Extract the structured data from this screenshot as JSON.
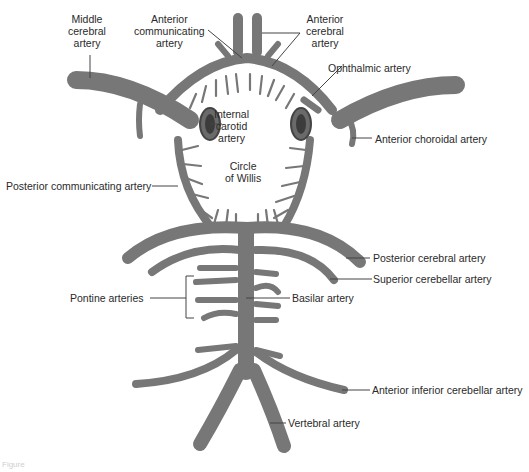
{
  "diagram": {
    "title": "Circle of Willis",
    "colors": {
      "vessel": "#7d7d7d",
      "vessel_edge": "#555555",
      "leader": "#444444",
      "text": "#2a2a2a",
      "background": "#ffffff"
    },
    "labels": {
      "middle_cerebral": [
        "Middle",
        "cerebral",
        "artery"
      ],
      "anterior_communicating": [
        "Anterior",
        "communicating",
        "artery"
      ],
      "anterior_cerebral": [
        "Anterior",
        "cerebral",
        "artery"
      ],
      "ophthalmic": "Ophthalmic artery",
      "internal_carotid": [
        "Internal",
        "carotid",
        "artery"
      ],
      "anterior_choroidal": "Anterior choroidal artery",
      "circle_of_willis": [
        "Circle",
        "of Willis"
      ],
      "posterior_communicating": "Posterior communicating artery",
      "posterior_cerebral": "Posterior cerebral artery",
      "superior_cerebellar": "Superior cerebellar artery",
      "pontine": "Pontine arteries",
      "basilar": "Basilar artery",
      "anterior_inferior_cerebellar": "Anterior inferior cerebellar artery",
      "vertebral": "Vertebral artery"
    },
    "caption": "Figure"
  }
}
